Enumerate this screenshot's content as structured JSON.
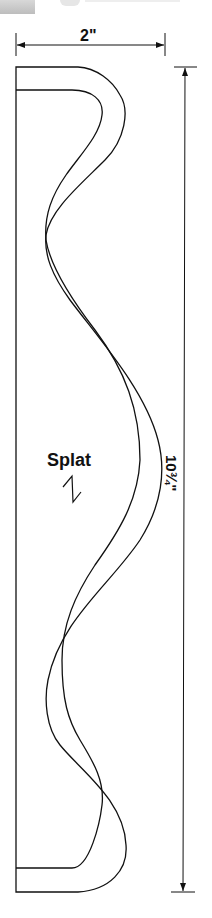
{
  "diagram": {
    "part_label": "Splat",
    "dimensions": {
      "width": "2\"",
      "height": "10¾\""
    },
    "colors": {
      "line": "#111111",
      "background": "#ffffff"
    }
  }
}
